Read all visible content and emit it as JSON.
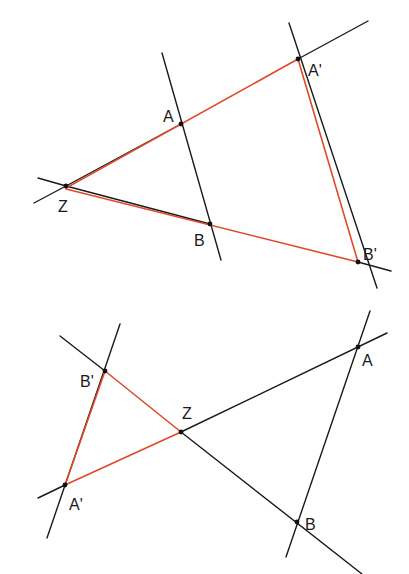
{
  "colors": {
    "construction_line": "#1a1a1a",
    "image_triangle": "#e0492a",
    "point": "#111111",
    "background": "#ffffff"
  },
  "figures": [
    {
      "id": "enlargement",
      "description": "Homothety with center Z, positive ratio (image on same side)",
      "points": {
        "Z": {
          "label": "Z",
          "x": 66,
          "y": 186,
          "lx": 58,
          "ly": 212
        },
        "A": {
          "label": "A",
          "x": 181,
          "y": 124,
          "lx": 163,
          "ly": 122
        },
        "B": {
          "label": "B",
          "x": 210,
          "y": 224,
          "lx": 194,
          "ly": 246
        },
        "A'": {
          "label": "A'",
          "x": 298,
          "y": 59,
          "lx": 308,
          "ly": 76
        },
        "B'": {
          "label": "B'",
          "x": 358,
          "y": 262,
          "lx": 363,
          "ly": 260
        }
      },
      "black_lines": [
        [
          162,
          53,
          221,
          260
        ],
        [
          289,
          23,
          377,
          288
        ],
        [
          298,
          59,
          368,
          21
        ],
        [
          358,
          262,
          391,
          271
        ],
        [
          66,
          186,
          181,
          124
        ],
        [
          66,
          186,
          210,
          224
        ],
        [
          38,
          178,
          66,
          186
        ],
        [
          34,
          203,
          66,
          186
        ]
      ],
      "red_lines": [
        [
          66,
          188,
          298,
          59
        ],
        [
          66,
          189,
          358,
          262
        ],
        [
          298,
          59,
          358,
          262
        ]
      ]
    },
    {
      "id": "reduction-negative",
      "description": "Homothety with center Z, negative ratio (image on opposite side)",
      "points": {
        "B'": {
          "label": "B'",
          "x": 105,
          "y": 371,
          "lx": 80,
          "ly": 387
        },
        "A'": {
          "label": "A'",
          "x": 65,
          "y": 485,
          "lx": 69,
          "ly": 510
        },
        "Z": {
          "label": "Z",
          "x": 181,
          "y": 432,
          "lx": 182,
          "ly": 419
        },
        "A": {
          "label": "A",
          "x": 358,
          "y": 347,
          "lx": 362,
          "ly": 366
        },
        "B": {
          "label": "B",
          "x": 297,
          "y": 522,
          "lx": 305,
          "ly": 530
        }
      },
      "black_lines": [
        [
          120,
          324,
          47,
          538
        ],
        [
          370,
          311,
          286,
          557
        ],
        [
          60,
          336,
          105,
          371
        ],
        [
          181,
          432,
          362,
          574
        ],
        [
          38,
          498,
          65,
          485
        ],
        [
          181,
          432,
          387,
          333
        ]
      ],
      "red_lines": [
        [
          105,
          371,
          65,
          485
        ],
        [
          105,
          371,
          181,
          432
        ],
        [
          65,
          485,
          181,
          432
        ]
      ]
    }
  ]
}
